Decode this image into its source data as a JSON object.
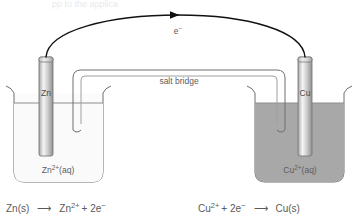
{
  "figure": {
    "title_fragment_cut_off": "pp                                       to the applica",
    "electron_label": "e",
    "electron_charge": "−",
    "salt_bridge_label": "salt bridge",
    "left_cell": {
      "electrode_label": "Zn",
      "solution_label_base": "Zn",
      "solution_label_sup": "2+",
      "solution_label_tail": "(aq)",
      "solution_color": "#fbfbfb",
      "half_reaction": {
        "reactant": "Zn(s)",
        "arrow": "⟶",
        "product_base": "Zn",
        "product_sup": "2+",
        "product_tail": "+ 2e",
        "product_tail_sup": "−"
      }
    },
    "right_cell": {
      "electrode_label": "Cu",
      "solution_label_base": "Cu",
      "solution_label_sup": "2+",
      "solution_label_tail": "(aq)",
      "solution_color": "#a8a8a8",
      "half_reaction": {
        "reactant_base": "Cu",
        "reactant_sup": "2+",
        "reactant_tail": "+ 2e",
        "reactant_tail_sup": "−",
        "arrow": "⟶",
        "product": "Cu(s)"
      }
    },
    "colors": {
      "outline": "#6f6f6f",
      "text": "#5d5d5d",
      "electrode_light": "#f2f2f2",
      "electrode_mid": "#c9c9c9",
      "electrode_dark": "#9a9a9a",
      "wire": "#1a1a1a",
      "copper_solution": "#a8a8a8",
      "zinc_solution": "#fbfbfb"
    }
  }
}
